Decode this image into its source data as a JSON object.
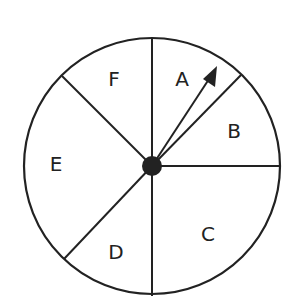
{
  "spinner": {
    "sections": [
      {
        "label": "A",
        "x": 182,
        "y": 80
      },
      {
        "label": "B",
        "x": 234,
        "y": 132
      },
      {
        "label": "C",
        "x": 208,
        "y": 235
      },
      {
        "label": "D",
        "x": 116,
        "y": 253
      },
      {
        "label": "E",
        "x": 56,
        "y": 165
      },
      {
        "label": "F",
        "x": 114,
        "y": 80
      }
    ],
    "pointer_section": "A",
    "colors": {
      "stroke": "#222222",
      "background": "#ffffff"
    }
  }
}
